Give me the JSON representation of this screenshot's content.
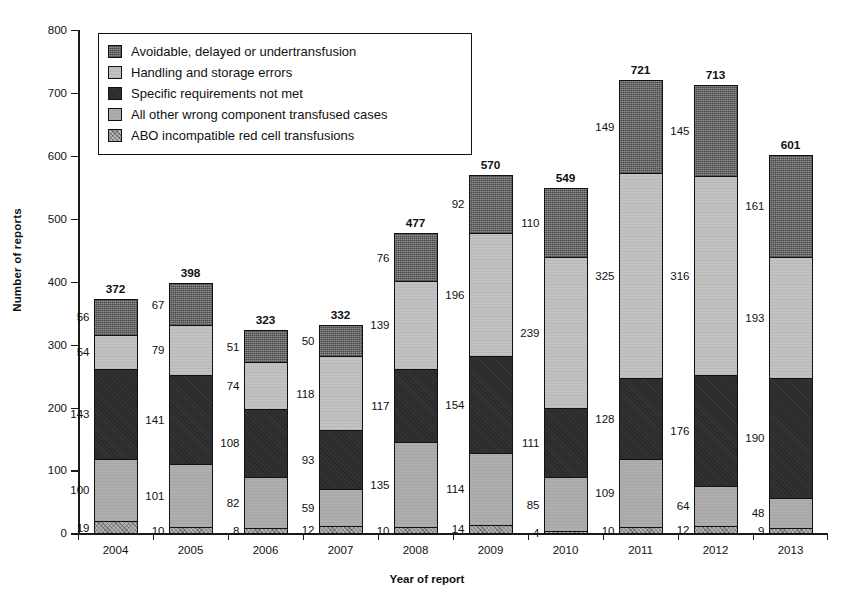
{
  "chart_data": {
    "type": "bar",
    "subtype": "stacked-bar",
    "title": "",
    "xlabel": "Year of report",
    "ylabel": "Number of reports",
    "ylim": [
      0,
      800
    ],
    "yticks": [
      0,
      100,
      200,
      300,
      400,
      500,
      600,
      700,
      800
    ],
    "grid": false,
    "legend_position": "top-left-inside",
    "categories": [
      "2004",
      "2005",
      "2006",
      "2007",
      "2008",
      "2009",
      "2010",
      "2011",
      "2012",
      "2013"
    ],
    "series": [
      {
        "name": "ABO incompatible red cell transfusions",
        "key": "abo",
        "color": "#b5b5b5",
        "stack_order": 1,
        "values": [
          19,
          10,
          8,
          12,
          10,
          14,
          4,
          10,
          12,
          9
        ]
      },
      {
        "name": "All other wrong component transfused cases",
        "key": "allother",
        "color": "#aeaeae",
        "stack_order": 2,
        "values": [
          100,
          101,
          82,
          59,
          135,
          114,
          85,
          109,
          64,
          48
        ]
      },
      {
        "name": "Specific requirements not met",
        "key": "specific",
        "color": "#2b2b2b",
        "stack_order": 3,
        "values": [
          143,
          141,
          108,
          93,
          117,
          154,
          111,
          128,
          176,
          190
        ]
      },
      {
        "name": "Handling and storage errors",
        "key": "handling",
        "color": "#c2c2c2",
        "stack_order": 4,
        "values": [
          54,
          79,
          74,
          118,
          139,
          196,
          239,
          325,
          316,
          193
        ]
      },
      {
        "name": "Avoidable, delayed or undertransfusion",
        "key": "avoidable",
        "color": "#6e6e6e",
        "stack_order": 5,
        "values": [
          56,
          67,
          51,
          50,
          76,
          92,
          110,
          149,
          145,
          161
        ]
      }
    ],
    "totals": [
      372,
      398,
      323,
      332,
      477,
      570,
      549,
      721,
      713,
      601
    ]
  },
  "legend": {
    "items": [
      {
        "label": "Avoidable, delayed or undertransfusion",
        "swatch": "fill-avoidable"
      },
      {
        "label": "Handling and storage errors",
        "swatch": "fill-handling"
      },
      {
        "label": "Specific requirements not met",
        "swatch": "fill-specific"
      },
      {
        "label": "All other wrong component transfused cases",
        "swatch": "fill-allother"
      },
      {
        "label": "ABO incompatible red cell transfusions",
        "swatch": "fill-abo"
      }
    ]
  }
}
